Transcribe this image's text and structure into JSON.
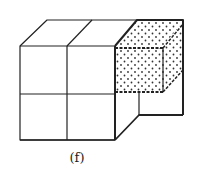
{
  "figure": {
    "caption": "(f)",
    "colors": {
      "line": "#222222",
      "dots": "#333333",
      "background": "#ffffff"
    }
  }
}
